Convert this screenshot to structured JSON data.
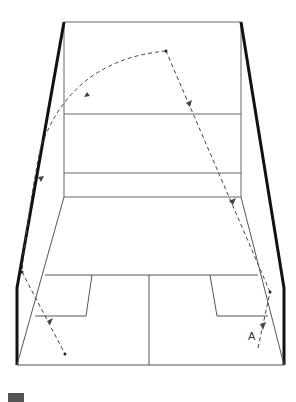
{
  "diagram": {
    "label_start": "A",
    "colors": {
      "outline": "#111111",
      "court_lines": "#555555",
      "trajectory": "#444444",
      "swatch": "#555555"
    },
    "court": {
      "front_wall": {
        "left": 64,
        "right": 241,
        "top": 22,
        "floor": 197
      },
      "service_line_y": 114,
      "tin_line_y": 173,
      "short_line_y": 275,
      "back_line_y": 365,
      "half_court_x": 149
    },
    "trajectory_points": [
      {
        "name": "A",
        "x": 258,
        "y": 348
      },
      {
        "name": "side-wall-right",
        "x": 270,
        "y": 292
      },
      {
        "name": "front-wall-hit",
        "x": 166,
        "y": 51
      },
      {
        "name": "side-wall-left",
        "x": 22,
        "y": 272
      },
      {
        "name": "floor-end",
        "x": 65,
        "y": 354
      }
    ]
  }
}
